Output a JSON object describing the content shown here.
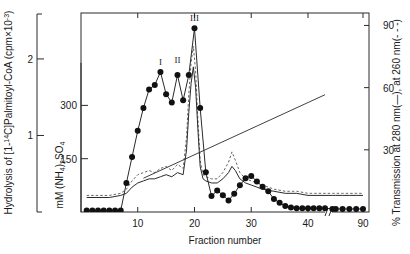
{
  "chart_data": {
    "type": "line",
    "title": "",
    "xlabel": "Fraction number",
    "xlim": [
      0,
      95
    ],
    "x_ticks": [
      10,
      20,
      30,
      40,
      90
    ],
    "x_axis_break": {
      "present": true,
      "after": 43,
      "label": "//"
    },
    "grid": false,
    "legend_position": "none",
    "axes": [
      {
        "id": "left-outer",
        "label": "Hydrolysis of [1-14C]Palmitoyl-CoA (cpm×10⁻³)",
        "label_plain": "Hydrolysis of [1-",
        "label_sup1": "14",
        "label_mid": "C]Palmitoyl-CoA (cpm×10",
        "label_sup2": "-3",
        "label_end": ")",
        "ticks": [
          1,
          2
        ],
        "ylim": [
          0,
          2.6
        ]
      },
      {
        "id": "left-inner",
        "label": "mM (NH4)2SO4",
        "label_pre": "mM (NH",
        "label_sub1": "4",
        "label_mid": ")",
        "label_sub2": "2",
        "label_post": "SO",
        "label_sub3": "4",
        "ticks": [
          150,
          300
        ],
        "ylim": [
          0,
          560
        ]
      },
      {
        "id": "right",
        "label": "% Transmission at 280 nm(—), at 260 nm(---)",
        "label_pre": "% Transmission at 280 nm(",
        "label_dash1": "—",
        "label_mid": "), at 260 nm(",
        "label_dash2": "- - -",
        "label_post": ")",
        "ticks": [
          30,
          60,
          90
        ],
        "ylim": [
          0,
          96
        ]
      }
    ],
    "annotations": [
      {
        "text": "I",
        "x": 14,
        "y": 1.83
      },
      {
        "text": "II",
        "x": 17,
        "y": 1.86
      },
      {
        "text": "III",
        "x": 20,
        "y": 2.4
      }
    ],
    "series": [
      {
        "name": "Hydrolysis of [1-14C]Palmitoyl-CoA",
        "axis": "left-outer",
        "style": "line-with-filled-circles",
        "marker": "filled-circle",
        "x": [
          1,
          2,
          3,
          4,
          5,
          6,
          7,
          8,
          9,
          10,
          11,
          12,
          13,
          14,
          15,
          16,
          17,
          18,
          19,
          20,
          21,
          22,
          23,
          24,
          25,
          26,
          27,
          28,
          29,
          30,
          31,
          32,
          33,
          34,
          35,
          36,
          37,
          38,
          39,
          40,
          41,
          42,
          43,
          45,
          50,
          60,
          70,
          80,
          90
        ],
        "y": [
          0.02,
          0.02,
          0.02,
          0.02,
          0.02,
          0.02,
          0.02,
          0.38,
          0.72,
          1.06,
          1.36,
          1.6,
          1.66,
          1.83,
          1.54,
          1.43,
          1.79,
          1.46,
          1.79,
          2.4,
          1.36,
          0.52,
          0.21,
          0.28,
          0.22,
          0.15,
          0.24,
          0.35,
          0.44,
          0.47,
          0.4,
          0.33,
          0.27,
          0.17,
          0.12,
          0.08,
          0.06,
          0.05,
          0.05,
          0.05,
          0.05,
          0.05,
          0.05,
          0.04,
          0.04,
          0.04,
          0.04,
          0.04,
          0.04
        ]
      },
      {
        "name": "% Transmission at 280 nm",
        "axis": "right",
        "style": "solid-line",
        "x": [
          1,
          3,
          5,
          7,
          8,
          9,
          10,
          11,
          12,
          13,
          14,
          15,
          16,
          17,
          18,
          18.6,
          19,
          19.4,
          19.8,
          20.2,
          20.6,
          21,
          21.5,
          22,
          23,
          24,
          25,
          26,
          26.6,
          27.2,
          28,
          29,
          30,
          31,
          32,
          34,
          36,
          38,
          40,
          43,
          45,
          50,
          60,
          70,
          80,
          90
        ],
        "y": [
          7,
          7,
          7,
          8,
          9,
          12,
          14,
          15,
          16,
          16,
          17,
          18,
          17,
          19,
          18,
          30,
          48,
          62,
          70,
          60,
          40,
          22,
          16,
          15,
          14,
          14,
          16,
          19,
          22,
          20,
          16,
          14,
          13,
          12,
          11,
          10,
          9,
          9,
          8,
          8,
          8,
          8,
          8,
          8,
          8,
          8
        ]
      },
      {
        "name": "% Transmission at 260 nm",
        "axis": "right",
        "style": "dashed-line",
        "x": [
          1,
          3,
          5,
          7,
          8,
          9,
          10,
          11,
          12,
          13,
          14,
          15,
          16,
          17,
          18,
          18.6,
          19,
          19.4,
          19.8,
          20.2,
          20.6,
          21,
          21.5,
          22,
          23,
          24,
          25,
          26,
          26.6,
          27.2,
          28,
          29,
          30,
          31,
          32,
          34,
          36,
          38,
          40,
          43,
          45,
          50,
          60,
          70,
          80,
          90
        ],
        "y": [
          8,
          8,
          8,
          9,
          11,
          15,
          18,
          19,
          20,
          19,
          21,
          22,
          20,
          23,
          21,
          36,
          57,
          72,
          80,
          68,
          45,
          25,
          18,
          17,
          16,
          16,
          19,
          24,
          29,
          25,
          19,
          16,
          15,
          14,
          13,
          11,
          10,
          10,
          9,
          9,
          9,
          9,
          9,
          9,
          9,
          9
        ]
      },
      {
        "name": "mM (NH4)2SO4 gradient",
        "axis": "left-inner",
        "style": "straight-line",
        "x": [
          11,
          43
        ],
        "y": [
          95,
          330
        ]
      }
    ]
  },
  "meta": {
    "x_break_marker": "//"
  }
}
